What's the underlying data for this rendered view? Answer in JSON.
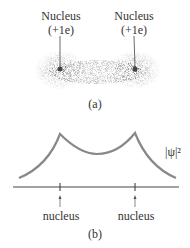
{
  "panel_a": {
    "left_label": "Nucleus",
    "left_charge": "(+1e)",
    "right_label": "Nucleus",
    "right_charge": "(+1e)",
    "caption": "(a)"
  },
  "panel_b": {
    "curve_label": "|ψ|²",
    "left_marker": "nucleus",
    "right_marker": "nucleus",
    "caption": "(b)",
    "curve_color": "#888888"
  }
}
